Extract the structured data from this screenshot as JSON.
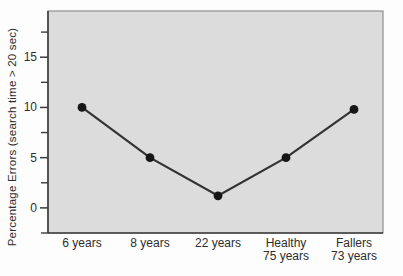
{
  "chart_data": {
    "type": "line",
    "title": "",
    "xlabel": "",
    "ylabel": "Percentage Errors (search time > 20 sec)",
    "categories": [
      [
        "6 years"
      ],
      [
        "8 years"
      ],
      [
        "22 years"
      ],
      [
        "Healthy",
        "75 years"
      ],
      [
        "Fallers",
        "73 years"
      ]
    ],
    "values": [
      10,
      5,
      1.2,
      5,
      9.8
    ],
    "ylim": [
      -2.5,
      19.6
    ],
    "yticks_major": [
      0,
      5,
      10,
      15
    ],
    "ytick_labels": [
      "0",
      "5",
      "10",
      "15"
    ],
    "yticks_minor": [
      -2.5,
      2.5,
      7.5,
      12.5,
      17.5
    ],
    "grid": false,
    "legend": null,
    "colors": {
      "plot_background": "#dcdcdc",
      "panel_border": "#8f8f8f",
      "axis": "#3c3c3c",
      "line": "#333333",
      "marker": "#161616",
      "text": "#2e2e2e",
      "page_background": "#fdfdfd"
    }
  }
}
